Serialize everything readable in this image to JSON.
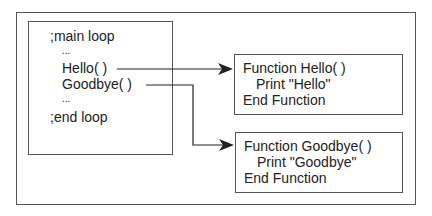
{
  "main_loop": {
    "lines": [
      ";main loop",
      "...",
      "Hello( )",
      "Goodbye( )",
      "...",
      ";end loop"
    ]
  },
  "functions": [
    {
      "lines": [
        "Function Hello( )",
        "Print \"Hello\"",
        "End Function"
      ]
    },
    {
      "lines": [
        "Function Goodbye( )",
        "Print \"Goodbye\"",
        "End Function"
      ]
    }
  ],
  "colors": {
    "line": "#222222",
    "border": "#555555"
  }
}
